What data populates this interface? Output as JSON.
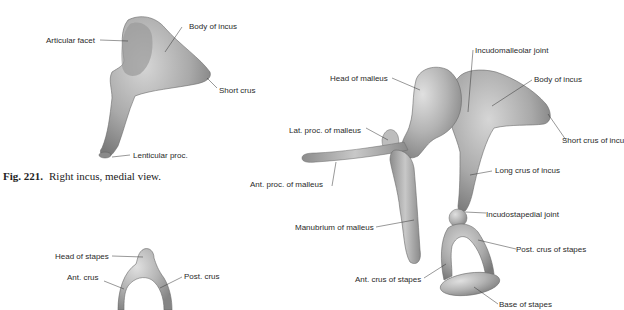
{
  "figure_221": {
    "caption_number": "Fig. 221.",
    "caption_text": "Right incus, medial view.",
    "labels": {
      "articular_facet": "Articular facet",
      "body_of_incus": "Body of incus",
      "short_crus": "Short crus",
      "lenticular_proc": "Lenticular proc."
    }
  },
  "stapes_figure": {
    "labels": {
      "head_of_stapes": "Head of stapes",
      "ant_crus": "Ant. crus",
      "post_crus": "Post. crus"
    }
  },
  "ossicles_figure": {
    "labels": {
      "incudomalleolar_joint": "Incudomalleolar joint",
      "head_of_malleus": "Head of malleus",
      "body_of_incus": "Body of incus",
      "short_crus_of_incus": "Short crus of incu",
      "lat_proc_of_malleus": "Lat. proc. of malleus",
      "ant_proc_of_malleus": "Ant. proc. of malleus",
      "long_crus_of_incus": "Long crus of incus",
      "manubrium_of_malleus": "Manubrium of malleus",
      "incudostapedial_joint": "Incudostapedial joint",
      "post_crus_of_stapes": "Post. crus of stapes",
      "ant_crus_of_stapes": "Ant. crus of stapes",
      "base_of_stapes": "Base of stapes"
    }
  }
}
